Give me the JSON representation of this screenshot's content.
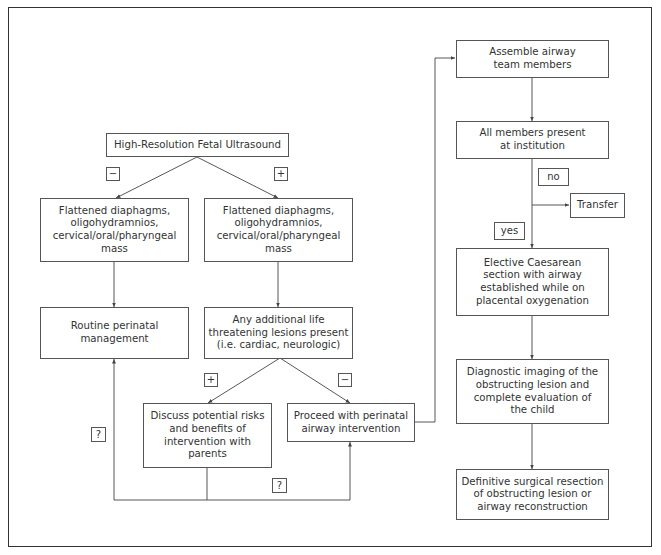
{
  "nodes": {
    "ultrasound": "High-Resolution Fetal Ultrasound",
    "findings_neg": "Flattened diaphagms,\noligohydramnios,\ncervical/oral/pharyngeal\nmass",
    "findings_pos": "Flattened diaphagms,\noligohydramnios,\ncervical/oral/pharyngeal\nmass",
    "routine": "Routine perinatal\nmanagement",
    "additional_lesions": "Any additional life\nthreatening lesions present\n(i.e. cardiac, neurologic)",
    "discuss": "Discuss potential risks\nand benefits of\nintervention with\nparents",
    "proceed": "Proceed with perinatal\nairway intervention",
    "assemble": "Assemble airway\nteam members",
    "all_present": "All members present\nat institution",
    "transfer": "Transfer",
    "caesarean": "Elective Caesarean\nsection with airway\nestablished while on\nplacental oxygenation",
    "diagnostic": "Diagnostic imaging of the\nobstructing lesion and\ncomplete evaluation of\nthe child",
    "definitive": "Definitive surgical resection\nof obstructing lesion or\nairway reconstruction"
  },
  "labels": {
    "neg1": "−",
    "pos1": "+",
    "pos2": "+",
    "neg2": "−",
    "q1": "?",
    "q2": "?",
    "no": "no",
    "yes": "yes"
  },
  "colors": {
    "line": "#444444",
    "border": "#555555",
    "text": "#333333"
  }
}
